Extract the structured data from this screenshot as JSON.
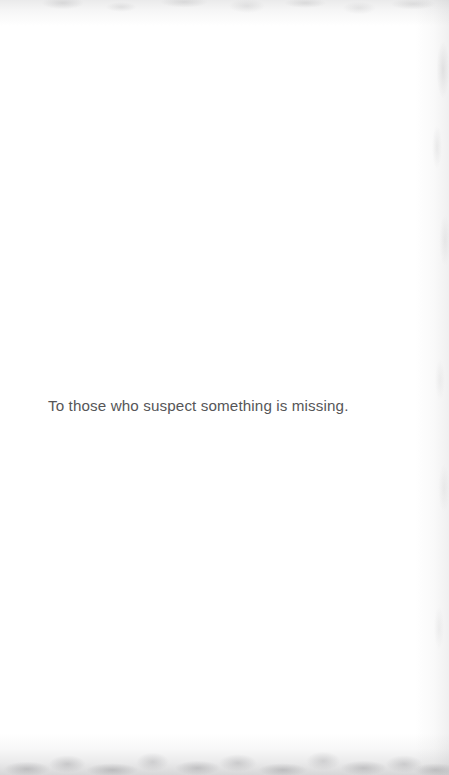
{
  "page": {
    "kind": "book-dedication-page",
    "background_color": "#ffffff",
    "width": 449,
    "height": 775
  },
  "dedication": {
    "text": "To those who suspect something is missing.",
    "color": "#565658",
    "align": "left"
  },
  "scan_artifacts": {
    "top_edge": {
      "label": "top scan edge shadow",
      "color": "#a0a0a2"
    },
    "right_edge": {
      "label": "right scan edge shadow",
      "color": "#a0a0a2"
    },
    "bottom_edge": {
      "label": "bottom scan edge shadow",
      "color": "#96969 9"
    }
  }
}
